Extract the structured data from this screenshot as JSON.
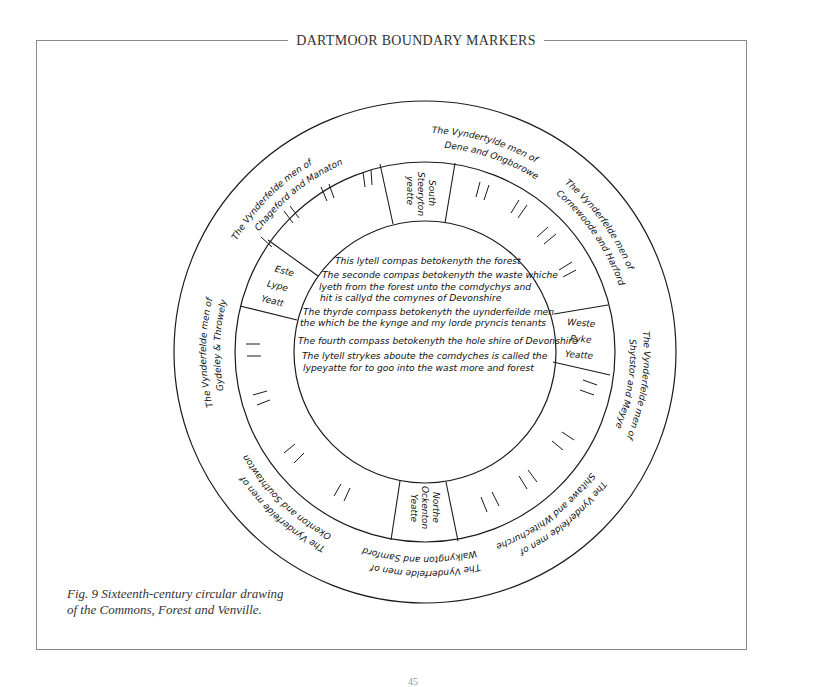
{
  "page": {
    "header_title": "DARTMOOR BOUNDARY MARKERS",
    "page_number": "45",
    "caption_line1": "Fig. 9  Sixteenth-century circular drawing",
    "caption_line2": "of the Commons, Forest and Venville."
  },
  "diagram": {
    "title": "Sixteenth-century circular drawing of the Commons, Forest and Venville",
    "line_color": "#1a1a1a",
    "center": {
      "x": 425,
      "y": 352
    },
    "radii": {
      "outer": 251,
      "middle": 190,
      "inner": 131
    },
    "inner_text": [
      "This lytell compas betokenyth the forest",
      "The seconde compas betokenyth the waste whiche",
      "lyeth from the forest unto the comdychys and",
      "hit is callyd the comynes of Devonshire",
      "The thyrde compass betokenyth the uynderfeilde men",
      "the which be the kynge and my lorde pryncis tenants",
      "The fourth compass betokenyth the hole shire of Devonshire",
      "The lytell strykes aboute the comdyches is called the",
      "lypeyatte for to goo into the wast more and forest"
    ],
    "gates": [
      {
        "name": "south-gate",
        "lines": [
          "South",
          "Steeryton",
          "yeatte"
        ]
      },
      {
        "name": "east-gate",
        "lines": [
          "Este",
          "Lype",
          "Yeatt"
        ]
      },
      {
        "name": "west-gate",
        "lines": [
          "Weste",
          "Pyke",
          "Yeatte"
        ]
      },
      {
        "name": "north-gate",
        "lines": [
          "Northe",
          "Ockenton",
          "Yeatte"
        ]
      }
    ],
    "venville_groups": [
      {
        "line1": "The Vynderfelde men of",
        "line2": "Chageford and Manaton"
      },
      {
        "line1": "The Vyndertylde men of",
        "line2": "Dene and Ongborowe"
      },
      {
        "line1": "The Vynderfelde men of",
        "line2": "Cornewoode and Harford"
      },
      {
        "line1": "The Vynderfelde men of",
        "line2": "Shytstor and Meyye"
      },
      {
        "line1": "The Vynderfelde men of",
        "line2": "Shitawe and Whitechurche"
      },
      {
        "line1": "The Vynderfelde men of",
        "line2": "Walkyngton and Samford"
      },
      {
        "line1": "The Vynderfelde men of",
        "line2": "Okenton and Southtawton"
      },
      {
        "line1": "The Vynderfelde men of",
        "line2": "Gydeley & Throwely"
      }
    ]
  }
}
